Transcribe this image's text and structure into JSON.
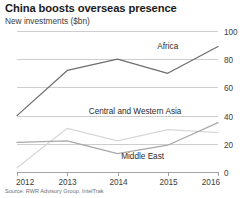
{
  "chart_data": {
    "type": "line",
    "title": "China boosts overseas presence",
    "subtitle": "New investments ($bn)",
    "source": "Source: RWR Advisory Group, IntelTrak",
    "xlabel": "",
    "ylabel": "",
    "x": [
      2012,
      2013,
      2014,
      2015,
      2016
    ],
    "xtick_labels": [
      "2012",
      "2013",
      "2014",
      "2015",
      "2016"
    ],
    "ytick_labels": [
      "0",
      "20",
      "40",
      "60",
      "80",
      "100"
    ],
    "yticks": [
      0,
      20,
      40,
      60,
      80,
      100
    ],
    "ylim": [
      0,
      100
    ],
    "xlim": [
      2012,
      2016
    ],
    "grid": true,
    "y_axis_position": "right",
    "legend": "inline-labels",
    "series": [
      {
        "name": "Africa",
        "color": "#6e6e6e",
        "values": [
          40,
          72,
          80,
          70,
          89
        ],
        "label_x": 2015.0,
        "label_y": 87
      },
      {
        "name": "Central and Western Asia",
        "color": "#d8d8d8",
        "values": [
          3,
          31,
          22,
          30,
          28
        ],
        "label_x": 2014.35,
        "label_y": 41
      },
      {
        "name": "Middle East",
        "color": "#a8a8a8",
        "values": [
          21,
          22,
          13,
          19,
          35
        ],
        "label_x": 2014.5,
        "label_y": 9
      }
    ]
  }
}
